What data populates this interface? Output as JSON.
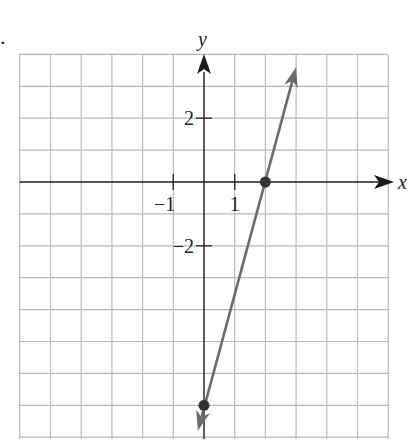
{
  "problem_marker": ".",
  "chart_data": {
    "type": "line",
    "title": "",
    "xlabel": "x",
    "ylabel": "y",
    "xlim": [
      -6,
      6
    ],
    "ylim": [
      -8,
      4
    ],
    "grid": true,
    "grid_step": 1,
    "tick_labels": {
      "x": [
        {
          "value": -1,
          "label": "−1"
        },
        {
          "value": 1,
          "label": "1"
        }
      ],
      "y": [
        {
          "value": 2,
          "label": "2"
        },
        {
          "value": -2,
          "label": "−2"
        }
      ]
    },
    "series": [
      {
        "name": "line",
        "equation": "y = 3.5x - 7",
        "slope": 3.5,
        "intercept": -7,
        "points": [
          {
            "x": 2,
            "y": 0
          },
          {
            "x": 0,
            "y": -7
          }
        ],
        "arrows_both_ends": true,
        "endpoints": [
          {
            "x": -0.2,
            "y": -7.8
          },
          {
            "x": 3.0,
            "y": 3.6
          }
        ],
        "color": "#6b6b6b"
      }
    ],
    "legend": null
  },
  "colors": {
    "grid": "#b8b8b8",
    "axis": "#1a1a1a",
    "line": "#6b6b6b",
    "point": "#333333"
  }
}
